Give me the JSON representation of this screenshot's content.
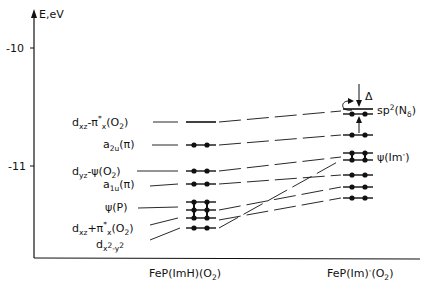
{
  "axis": {
    "y_label": "E,eV",
    "ticks": [
      {
        "label": "-10",
        "value": -10
      },
      {
        "label": "-11",
        "value": -11
      }
    ]
  },
  "columns": [
    {
      "name": "FeP(ImH)(O2)",
      "label_main": "FeP(ImH)(O",
      "label_sub": "2",
      "label_end": ")"
    },
    {
      "name": "FeP(Im)^-(O2)",
      "label_main": "FeP(Im)",
      "label_sup": "-",
      "label_mid": "(O",
      "label_sub": "2",
      "label_end": ")"
    }
  ],
  "left_labels": [
    {
      "id": "dxz-pi-x-O2",
      "text": "dxz-π*x(O2)"
    },
    {
      "id": "a2u-pi",
      "text": "a2u(π)"
    },
    {
      "id": "dyz-psi-O2",
      "text": "dyz-ψ(O2)"
    },
    {
      "id": "a1u-pi",
      "text": "a1u(π)"
    },
    {
      "id": "psi-P",
      "text": "ψ(P)"
    },
    {
      "id": "dxz-plus-pi-x-O2",
      "text": "dxz+π*x(O2)"
    },
    {
      "id": "dx2-y2",
      "text": "dx²-y²"
    }
  ],
  "right_labels": [
    {
      "id": "sp2-N-delta",
      "text": "sp²(Nδ)"
    },
    {
      "id": "psi-Im-minus",
      "text": "ψ(Im⁻)"
    }
  ],
  "annotation": {
    "delta": "Δ"
  },
  "levels": {
    "left": [
      {
        "y": 122,
        "occupied": false
      },
      {
        "y": 145,
        "occupied": true
      },
      {
        "y": 171,
        "occupied": true
      },
      {
        "y": 184,
        "occupied": true
      },
      {
        "y": 202,
        "occupied": true
      },
      {
        "y": 210,
        "occupied": true
      },
      {
        "y": 218,
        "occupied": true
      },
      {
        "y": 228,
        "occupied": true
      }
    ],
    "right": [
      {
        "y": 110,
        "occupied": false
      },
      {
        "y": 113,
        "occupied": true
      },
      {
        "y": 135,
        "occupied": true
      },
      {
        "y": 153,
        "occupied": true
      },
      {
        "y": 160,
        "occupied": true
      },
      {
        "y": 175,
        "occupied": true
      },
      {
        "y": 187,
        "occupied": true
      },
      {
        "y": 198,
        "occupied": true
      }
    ]
  }
}
